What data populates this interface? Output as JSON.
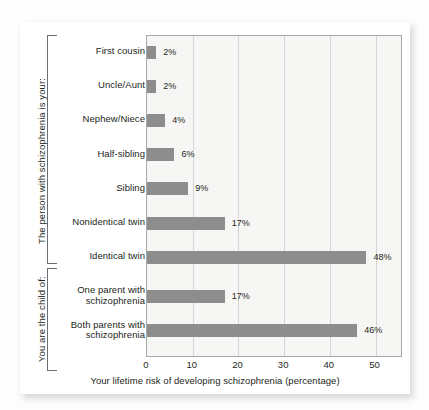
{
  "chart_data": {
    "type": "bar",
    "orientation": "horizontal",
    "title": "",
    "xlabel": "Your lifetime risk of developing schizophrenia (percentage)",
    "ylabel": "",
    "xlim": [
      0,
      56
    ],
    "xticks": [
      0,
      10,
      20,
      30,
      40,
      50
    ],
    "xtick_labels": [
      "0",
      "10",
      "20",
      "30",
      "40",
      "50"
    ],
    "grid": true,
    "legend": false,
    "bar_color": "#8d8d8d",
    "plot_background": "#f6f6f4",
    "categories": [
      "First cousin",
      "Uncle/Aunt",
      "Nephew/Niece",
      "Half-sibling",
      "Sibling",
      "Nonidentical twin",
      "Identical twin",
      "One parent with schizophrenia",
      "Both parents with schizophrenia"
    ],
    "values": [
      2,
      2,
      4,
      6,
      9,
      17,
      48,
      17,
      46
    ],
    "value_labels": [
      "2%",
      "2%",
      "4%",
      "6%",
      "9%",
      "17%",
      "48%",
      "17%",
      "46%"
    ],
    "groups": [
      {
        "caption": "The person with schizophrenia is your:",
        "categories": [
          "First cousin",
          "Uncle/Aunt",
          "Nephew/Niece",
          "Half-sibling",
          "Sibling",
          "Nonidentical twin",
          "Identical twin"
        ]
      },
      {
        "caption": "You are the child of:",
        "categories": [
          "One parent with schizophrenia",
          "Both parents with schizophrenia"
        ]
      }
    ]
  },
  "labels": {
    "rows": [
      {
        "line1": "First cousin",
        "line2": ""
      },
      {
        "line1": "Uncle/Aunt",
        "line2": ""
      },
      {
        "line1": "Nephew/Niece",
        "line2": ""
      },
      {
        "line1": "Half-sibling",
        "line2": ""
      },
      {
        "line1": "Sibling",
        "line2": ""
      },
      {
        "line1": "Nonidentical twin",
        "line2": ""
      },
      {
        "line1": "Identical twin",
        "line2": ""
      },
      {
        "line1": "One parent with",
        "line2": "schizophrenia"
      },
      {
        "line1": "Both parents with",
        "line2": "schizophrenia"
      }
    ]
  }
}
